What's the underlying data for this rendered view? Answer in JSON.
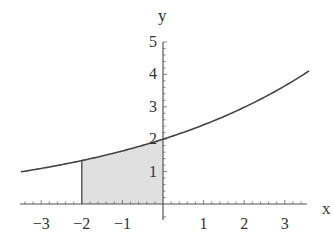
{
  "chart_data": {
    "type": "line",
    "title": "",
    "xlabel": "x",
    "ylabel": "y",
    "function": "y = 2e^(x/5)",
    "xlim": [
      -3.6,
      3.6
    ],
    "ylim": [
      0,
      5
    ],
    "x_ticks": [
      -3,
      -2,
      -1,
      1,
      2,
      3
    ],
    "x_tick_labels": [
      "−3",
      "−2",
      "−1",
      "1",
      "2",
      "3"
    ],
    "y_ticks": [
      1,
      2,
      3,
      4,
      5
    ],
    "y_tick_labels": [
      "1",
      "2",
      "3",
      "4",
      "5"
    ],
    "minor_tick_step": 0.2,
    "grid": false,
    "series": [
      {
        "name": "curve",
        "x": [
          -3.5,
          -3,
          -2.5,
          -2,
          -1.5,
          -1,
          -0.5,
          0,
          0.5,
          1,
          1.5,
          2,
          2.5,
          3,
          3.6
        ],
        "values": [
          0.99,
          1.1,
          1.21,
          1.34,
          1.48,
          1.64,
          1.81,
          2.0,
          2.21,
          2.44,
          2.7,
          2.98,
          3.3,
          3.64,
          4.11
        ]
      }
    ],
    "shaded_region": {
      "from_x": -2,
      "to_x": 0,
      "under": "curve",
      "color": "#e0e0e0"
    },
    "colors": {
      "curve": "#444444",
      "axis": "#555555",
      "fill": "#e0e0e0"
    }
  }
}
